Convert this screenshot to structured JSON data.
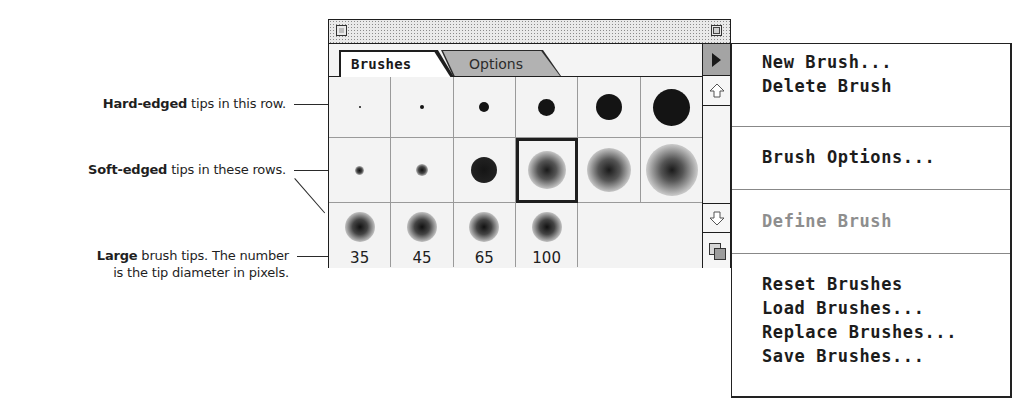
{
  "callouts": [
    {
      "bold": "Hard-edged",
      "text": " tips in this row."
    },
    {
      "bold": "Soft-edged",
      "text": " tips in these rows."
    },
    {
      "bold": "Large",
      "text": " brush tips. The number",
      "line2": "is the tip diameter in pixels."
    }
  ],
  "palette": {
    "tabs": [
      {
        "label": "Brushes",
        "active": true
      },
      {
        "label": "Options",
        "active": false
      }
    ],
    "rows": [
      {
        "type": "hard",
        "tips": [
          2,
          4,
          10,
          16,
          26,
          38
        ]
      },
      {
        "type": "soft",
        "tips": [
          8,
          10,
          26,
          34,
          40,
          48
        ],
        "selected_index": 3
      },
      {
        "type": "large",
        "tips": [
          35,
          45,
          65,
          100
        ],
        "labels": [
          "35",
          "45",
          "65",
          "100"
        ]
      }
    ]
  },
  "menu": {
    "items": [
      {
        "label": "New Brush...",
        "enabled": true
      },
      {
        "label": "Delete Brush",
        "enabled": true
      },
      {
        "label": "Brush Options...",
        "enabled": true
      },
      {
        "label": "Define Brush",
        "enabled": false
      },
      {
        "label": "Reset Brushes",
        "enabled": true
      },
      {
        "label": "Load Brushes...",
        "enabled": true
      },
      {
        "label": "Replace Brushes...",
        "enabled": true
      },
      {
        "label": "Save Brushes...",
        "enabled": true
      }
    ]
  },
  "colors": {
    "frame": "#1e1e1e",
    "tab_inactive": "#b2b2b2",
    "menu_disabled": "#8e8e8e",
    "grid_line": "#9a9a9a"
  }
}
